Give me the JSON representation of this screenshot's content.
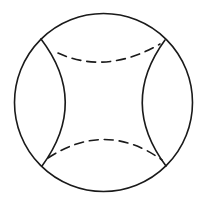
{
  "diagram": {
    "canvas": {
      "width": 203,
      "height": 201,
      "background": "#ffffff"
    },
    "stroke_color": "#1a1a1a",
    "outer_circle": {
      "cx": 103.5,
      "cy": 102.5,
      "r": 89
    },
    "junctions": {
      "top_left": [
        41,
        39
      ],
      "top_right": [
        165,
        40
      ],
      "bottom_left": [
        42,
        166
      ],
      "bottom_right": [
        166,
        166
      ]
    },
    "solid_arcs": {
      "left": {
        "from": [
          41,
          39
        ],
        "control": [
          89,
          102
        ],
        "to": [
          42,
          166
        ]
      },
      "right": {
        "from": [
          165,
          40
        ],
        "control": [
          119,
          103
        ],
        "to": [
          166,
          166
        ]
      }
    },
    "dashed_arcs": {
      "top": {
        "from": [
          58,
          53
        ],
        "control": [
          106,
          75
        ],
        "to": [
          160,
          44
        ]
      },
      "bottom": {
        "from": [
          48,
          158
        ],
        "control": [
          106,
          120
        ],
        "to": [
          162,
          160
        ]
      }
    },
    "labels": []
  }
}
